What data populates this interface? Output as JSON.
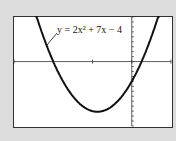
{
  "chart_data": {
    "type": "line",
    "title": "",
    "xlabel": "",
    "ylabel": "",
    "series": [
      {
        "name": "y = 2x^2 + 7x - 4",
        "equation": "2x^2+7x-4"
      }
    ],
    "annotation": "y = 2x² + 7x − 4",
    "xlim": [
      -6,
      2
    ],
    "ylim": [
      -13,
      9
    ],
    "x_tick_step": 2,
    "y_tick_step": 1,
    "roots": [
      -4,
      0.5
    ],
    "vertex": [
      -1.75,
      -10.125
    ],
    "grid": false
  },
  "colors": {
    "panel": "#dcdcdc",
    "screen": "#ffffff",
    "curve": "#111111"
  }
}
